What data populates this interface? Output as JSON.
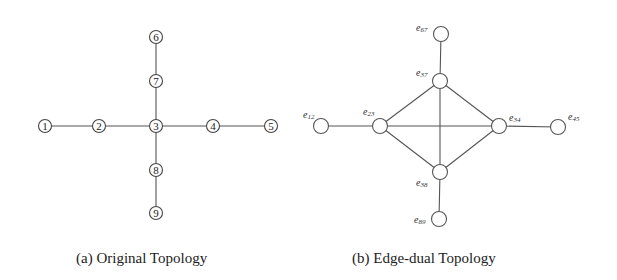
{
  "figure": {
    "panel_a": {
      "caption": "(a) Original Topology",
      "nodes": [
        {
          "id": "1",
          "label": "1",
          "x": 45,
          "y": 126
        },
        {
          "id": "2",
          "label": "2",
          "x": 99,
          "y": 126
        },
        {
          "id": "3",
          "label": "3",
          "x": 156,
          "y": 126
        },
        {
          "id": "4",
          "label": "4",
          "x": 213,
          "y": 126
        },
        {
          "id": "5",
          "label": "5",
          "x": 271,
          "y": 126
        },
        {
          "id": "6",
          "label": "6",
          "x": 156,
          "y": 37
        },
        {
          "id": "7",
          "label": "7",
          "x": 156,
          "y": 81
        },
        {
          "id": "8",
          "label": "8",
          "x": 156,
          "y": 170
        },
        {
          "id": "9",
          "label": "9",
          "x": 156,
          "y": 213
        }
      ],
      "edges": [
        [
          "1",
          "2"
        ],
        [
          "2",
          "3"
        ],
        [
          "3",
          "4"
        ],
        [
          "4",
          "5"
        ],
        [
          "6",
          "7"
        ],
        [
          "7",
          "3"
        ],
        [
          "3",
          "8"
        ],
        [
          "8",
          "9"
        ]
      ]
    },
    "panel_b": {
      "caption": "(b) Edge-dual Topology",
      "nodes": [
        {
          "id": "e12",
          "base": "e",
          "sub": "12",
          "x": 321,
          "y": 126,
          "lx": 303,
          "ly": 118
        },
        {
          "id": "e23",
          "base": "e",
          "sub": "23",
          "x": 380,
          "y": 126,
          "lx": 363,
          "ly": 115
        },
        {
          "id": "e34",
          "base": "e",
          "sub": "34",
          "x": 499,
          "y": 126,
          "lx": 509,
          "ly": 121
        },
        {
          "id": "e45",
          "base": "e",
          "sub": "45",
          "x": 558,
          "y": 127,
          "lx": 568,
          "ly": 120
        },
        {
          "id": "e67",
          "base": "e",
          "sub": "67",
          "x": 441,
          "y": 34,
          "lx": 416,
          "ly": 31
        },
        {
          "id": "e37",
          "base": "e",
          "sub": "37",
          "x": 440,
          "y": 81,
          "lx": 416,
          "ly": 76
        },
        {
          "id": "e38",
          "base": "e",
          "sub": "38",
          "x": 440,
          "y": 172,
          "lx": 416,
          "ly": 186
        },
        {
          "id": "e89",
          "base": "e",
          "sub": "89",
          "x": 439,
          "y": 219,
          "lx": 414,
          "ly": 223
        }
      ],
      "edges": [
        [
          "e12",
          "e23"
        ],
        [
          "e23",
          "e34"
        ],
        [
          "e34",
          "e45"
        ],
        [
          "e67",
          "e37"
        ],
        [
          "e37",
          "e38"
        ],
        [
          "e38",
          "e89"
        ],
        [
          "e23",
          "e37"
        ],
        [
          "e37",
          "e34"
        ],
        [
          "e23",
          "e38"
        ],
        [
          "e38",
          "e34"
        ]
      ]
    }
  }
}
